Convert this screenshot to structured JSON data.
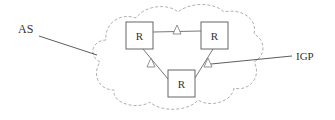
{
  "diagram": {
    "type": "network-topology",
    "cloud_label": "AS",
    "link_label": "IGP",
    "routers": [
      {
        "id": "r1",
        "label": "R",
        "x": 126,
        "y": 22
      },
      {
        "id": "r2",
        "label": "R",
        "x": 201,
        "y": 22
      },
      {
        "id": "r3",
        "label": "R",
        "x": 168,
        "y": 70
      }
    ],
    "links": [
      {
        "from": "r1",
        "to": "r2"
      },
      {
        "from": "r1",
        "to": "r3"
      },
      {
        "from": "r2",
        "to": "r3"
      }
    ],
    "colors": {
      "cloud_stroke": "#b0b0b0",
      "line": "#555555",
      "box_stroke": "#666666",
      "text": "#333333"
    }
  }
}
